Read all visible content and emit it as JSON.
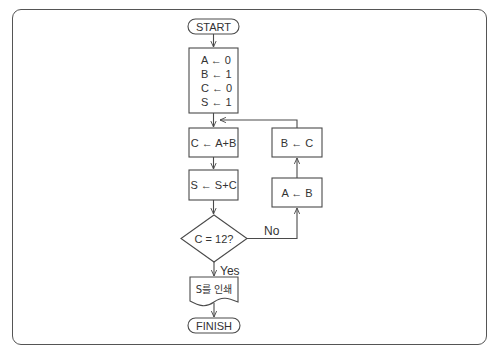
{
  "flowchart": {
    "start": {
      "label": "START"
    },
    "init": {
      "lines": [
        "A ← 0",
        "B ← 1",
        "C ← 0",
        "S ← 1"
      ]
    },
    "step_c": {
      "label": "C ← A+B"
    },
    "step_s": {
      "label": "S ← S+C"
    },
    "decision": {
      "label": "C = 12?"
    },
    "yes_label": "Yes",
    "no_label": "No",
    "print": {
      "label": "S를 인쇄"
    },
    "step_a": {
      "label": "A ← B"
    },
    "step_b": {
      "label": "B ← C"
    },
    "finish": {
      "label": "FINISH"
    }
  },
  "colors": {
    "line": "#4a4a4a",
    "text": "#333333",
    "background": "#ffffff",
    "frame": "#555555"
  }
}
